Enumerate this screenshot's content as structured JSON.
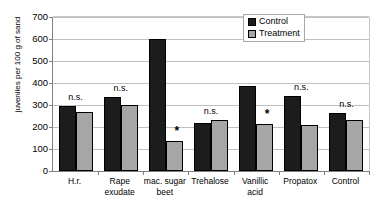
{
  "chart_data": {
    "type": "bar",
    "title": "",
    "xlabel": "",
    "ylabel": "juveniles per 100 g of sand",
    "ylim": [
      0,
      700
    ],
    "ytick_step": 100,
    "yticks": [
      "700",
      "600",
      "500",
      "400",
      "300",
      "200",
      "100",
      "0"
    ],
    "grid": true,
    "legend_position": "top-right",
    "categories": [
      "H.r.",
      "Rape\nexudate",
      "mac. sugar\nbeet",
      "Trehalose",
      "Vanillic\nacid",
      "Propatox",
      "Control"
    ],
    "series": [
      {
        "name": "Control",
        "color": "#1c1c1c",
        "values": [
          295,
          337,
          600,
          220,
          385,
          340,
          263
        ]
      },
      {
        "name": "Treatment",
        "color": "#a6a6a6",
        "values": [
          270,
          298,
          135,
          233,
          215,
          207,
          230
        ]
      }
    ],
    "annotations": [
      {
        "category": "H.r.",
        "text": "n.s.",
        "type": "ns"
      },
      {
        "category": "Rape exudate",
        "text": "n.s.",
        "type": "ns"
      },
      {
        "category": "mac. sugar beet",
        "text": "*",
        "type": "star"
      },
      {
        "category": "Trehalose",
        "text": "n.s.",
        "type": "ns"
      },
      {
        "category": "Vanillic acid",
        "text": "*",
        "type": "star"
      },
      {
        "category": "Propatox",
        "text": "n.s.",
        "type": "ns"
      },
      {
        "category": "Control",
        "text": "n.s.",
        "type": "ns"
      }
    ]
  },
  "legend": {
    "items": [
      {
        "label": "Control"
      },
      {
        "label": "Treatment"
      }
    ]
  }
}
